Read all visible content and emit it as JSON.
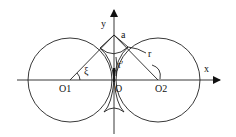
{
  "diagram": {
    "type": "geometry",
    "labels": {
      "y_axis": "y",
      "x_axis": "x",
      "point_a": "a",
      "radius_r": "r",
      "radius_r_prime": "r'",
      "angle_xi": "ξ",
      "center_left": "O1",
      "origin": "O",
      "center_right": "O2"
    },
    "colors": {
      "line": "#222222",
      "background": "#ffffff"
    }
  }
}
